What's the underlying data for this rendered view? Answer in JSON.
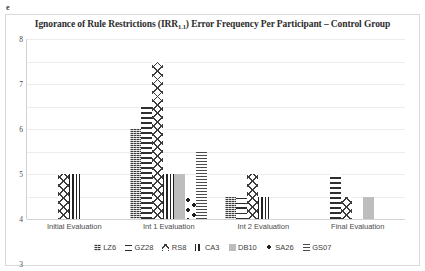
{
  "corner_mark": "e",
  "chart_data": {
    "type": "bar",
    "title": "Ignorance of Rule Restrictions (IRR",
    "title_subscript": "1.1",
    "title_suffix": ") Error Frequency Per Participant  –  Control Group",
    "title_full": "Ignorance of Rule Restrictions (IRR1.1) Error Frequency Per Participant  –  Control Group",
    "xlabel": "",
    "ylabel": "",
    "ylim": [
      0,
      8
    ],
    "yticks": [
      8,
      7,
      6,
      5,
      4,
      3,
      2,
      1,
      0
    ],
    "grid": true,
    "legend_position": "bottom",
    "categories": [
      "Initial Evaluation",
      "Int 1 Evaluation",
      "Int 2 Evaluation",
      "Final Evaluation"
    ],
    "series": [
      {
        "name": "LZ6",
        "pattern": "dark-dotted-vertical",
        "values": [
          0,
          4,
          1,
          0
        ]
      },
      {
        "name": "GZ28",
        "pattern": "brick-hatch",
        "values": [
          0,
          5,
          1,
          2
        ]
      },
      {
        "name": "RS8",
        "pattern": "cross-diagonal",
        "values": [
          2,
          7,
          2,
          1
        ]
      },
      {
        "name": "CA3",
        "pattern": "vertical-lines",
        "values": [
          2,
          2,
          1,
          0
        ]
      },
      {
        "name": "DB10",
        "pattern": "solid-gray",
        "values": [
          0,
          2,
          0,
          1
        ]
      },
      {
        "name": "SA26",
        "pattern": "large-dots",
        "values": [
          0,
          1,
          0,
          0
        ]
      },
      {
        "name": "GS07",
        "pattern": "horizontal-lines",
        "values": [
          0,
          3,
          0,
          0
        ]
      }
    ]
  },
  "colors": {
    "grid": "#ececec",
    "axis": "#d2d2d2",
    "text": "#3f3f3f",
    "solid_gray": "#bdbdbd",
    "dark": "#2e2e2e"
  }
}
